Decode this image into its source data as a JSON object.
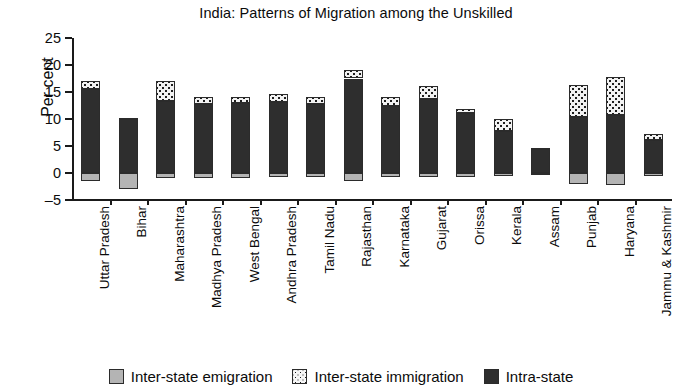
{
  "chart_data": {
    "type": "bar",
    "title": "India: Patterns of Migration among the Unskilled",
    "xlabel": "",
    "ylabel": "Per cent",
    "ylim": [
      -5,
      25
    ],
    "yticks": [
      -5,
      0,
      5,
      10,
      15,
      20,
      25
    ],
    "ytick_labels": [
      "–5",
      "0",
      "5",
      "10",
      "15",
      "20",
      "25"
    ],
    "grid": false,
    "legend_position": "bottom",
    "stacked": true,
    "categories": [
      "Uttar Pradesh",
      "Bihar",
      "Maharashtra",
      "Madhya Pradesh",
      "West Bengal",
      "Andhra Pradesh",
      "Tamil Nadu",
      "Rajasthan",
      "Karnataka",
      "Gujarat",
      "Orissa",
      "Kerala",
      "Assam",
      "Punjab",
      "Haryana",
      "Jammu & Kashmir"
    ],
    "series": [
      {
        "name": "Intra-state",
        "color": "#2e2e2e",
        "values": [
          15.5,
          10.0,
          13.4,
          12.8,
          13.0,
          13.2,
          12.8,
          17.5,
          12.4,
          13.7,
          11.2,
          7.8,
          4.5,
          10.3,
          10.8,
          6.2
        ]
      },
      {
        "name": "Inter-state immigration",
        "color": "#f2f2f2",
        "values": [
          1.6,
          0.2,
          3.6,
          1.3,
          1.1,
          1.4,
          1.2,
          1.6,
          1.7,
          2.4,
          0.7,
          2.2,
          0.2,
          6.0,
          7.0,
          1.0
        ]
      },
      {
        "name": "Inter-state emigration",
        "color": "#b4b4b4",
        "values": [
          -1.5,
          -3.0,
          -1.0,
          -1.0,
          -1.0,
          -0.8,
          -0.8,
          -1.5,
          -0.8,
          -0.8,
          -0.8,
          -0.5,
          -0.2,
          -2.0,
          -2.2,
          -0.6
        ]
      }
    ],
    "totals_top": [
      17.1,
      10.2,
      17.0,
      14.1,
      14.1,
      14.6,
      14.0,
      19.1,
      14.1,
      16.1,
      11.9,
      10.0,
      4.7,
      16.3,
      17.8,
      7.2
    ]
  },
  "legend": {
    "items": [
      {
        "label": "Inter-state emigration",
        "swatch": "emigration-swatch"
      },
      {
        "label": "Inter-state immigration",
        "swatch": "immigration-swatch"
      },
      {
        "label": "Intra-state",
        "swatch": "intra-state-swatch"
      }
    ]
  }
}
